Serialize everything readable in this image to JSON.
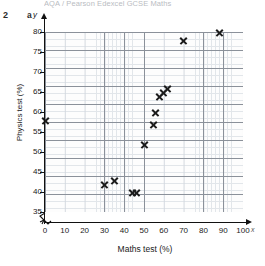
{
  "page": {
    "header_faded_text": "AQA / Pearson Edexcel GCSE Maths",
    "question_number": "2",
    "question_part": "a"
  },
  "axes": {
    "y_axis_letter": "y",
    "x_axis_letter": "x",
    "y_title": "Physics test (%)",
    "x_title": "Maths test (%)",
    "y_ticks": [
      "80",
      "75",
      "70",
      "65",
      "60",
      "55",
      "50",
      "45",
      "40",
      "35"
    ],
    "x_ticks": [
      "0",
      "10",
      "20",
      "30",
      "40",
      "50",
      "60",
      "70",
      "80",
      "90",
      "100"
    ],
    "has_y_break": true,
    "has_x_break": true
  },
  "colors": {
    "marker": "#1c1c1c",
    "grid_major": "#8b919a",
    "grid_minor": "#d3d8df",
    "axis": "#111111",
    "plot_background": "#fdfdfd"
  },
  "chart_data": {
    "type": "scatter",
    "title": "",
    "xlabel": "Maths test (%)",
    "ylabel": "Physics test (%)",
    "xlim": [
      0,
      100
    ],
    "ylim": [
      35,
      80
    ],
    "xtick_step": 10,
    "ytick_step": 5,
    "grid": true,
    "legend": "none",
    "axis_break_y": true,
    "axis_break_x": true,
    "points": [
      {
        "x": 0,
        "y": 58
      },
      {
        "x": 30,
        "y": 42
      },
      {
        "x": 35,
        "y": 43
      },
      {
        "x": 44,
        "y": 40
      },
      {
        "x": 46,
        "y": 40
      },
      {
        "x": 50,
        "y": 52
      },
      {
        "x": 55,
        "y": 57
      },
      {
        "x": 56,
        "y": 60
      },
      {
        "x": 58,
        "y": 64
      },
      {
        "x": 60,
        "y": 65
      },
      {
        "x": 62,
        "y": 66
      },
      {
        "x": 70,
        "y": 78
      },
      {
        "x": 88,
        "y": 80
      }
    ],
    "marker": "x",
    "n_points": 13
  }
}
